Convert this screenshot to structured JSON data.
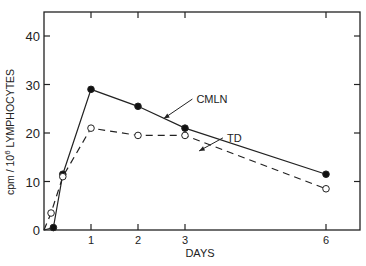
{
  "chart_data": {
    "type": "line",
    "title": "",
    "xlabel": "DAYS",
    "ylabel": "cpm / 10⁶ LYMPHOCYTES",
    "ylabel_parts": {
      "pre": "cpm / 10",
      "sup": "6",
      "post": " LYMPHOCYTES"
    },
    "xlim": [
      0,
      6.75
    ],
    "ylim": [
      0,
      45
    ],
    "x_ticks": [
      1,
      2,
      3,
      6
    ],
    "x_tick_labels": [
      "1",
      "2",
      "3",
      "6"
    ],
    "y_ticks": [
      0,
      10,
      20,
      30,
      40
    ],
    "y_tick_labels": [
      "0",
      "10",
      "20",
      "30",
      "40"
    ],
    "grid": false,
    "legend": "inline annotations with arrows",
    "series": [
      {
        "name": "CMLN",
        "marker": "filled-circle",
        "line": "solid",
        "points": [
          {
            "x": 0.2,
            "y": 0.5
          },
          {
            "x": 0.4,
            "y": 11.5
          },
          {
            "x": 1,
            "y": 29
          },
          {
            "x": 2,
            "y": 25.5
          },
          {
            "x": 3,
            "y": 21
          },
          {
            "x": 6,
            "y": 11.5
          }
        ]
      },
      {
        "name": "TD",
        "marker": "open-circle",
        "line": "dashed",
        "points": [
          {
            "x": 0.15,
            "y": 3.5
          },
          {
            "x": 0.4,
            "y": 11
          },
          {
            "x": 1,
            "y": 21
          },
          {
            "x": 2,
            "y": 19.5
          },
          {
            "x": 3,
            "y": 19.5
          },
          {
            "x": 6,
            "y": 8.5
          }
        ]
      }
    ],
    "annotations": [
      {
        "text": "CMLN",
        "label_x": 3.2,
        "label_y": 27,
        "arrow_to_x": 2.55,
        "arrow_to_y": 23
      },
      {
        "text": "TD",
        "label_x": 3.85,
        "label_y": 19,
        "arrow_to_x": 3.3,
        "arrow_to_y": 16.3
      }
    ]
  }
}
